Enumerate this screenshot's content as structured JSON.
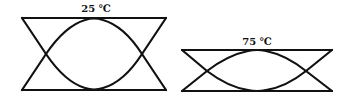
{
  "diagrams": [
    {
      "label": "25 ℃",
      "temperature": 25,
      "unit": "℃"
    },
    {
      "label": "75 ℃",
      "temperature": 75,
      "unit": "℃"
    }
  ],
  "colors": {
    "stroke": "#111111",
    "background": "#ffffff"
  }
}
